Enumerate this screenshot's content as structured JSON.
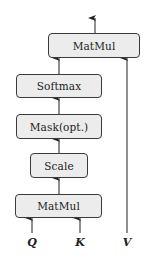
{
  "diagram": {
    "nodes": [
      {
        "id": "matmul_top",
        "label": "MatMul"
      },
      {
        "id": "softmax",
        "label": "Softmax"
      },
      {
        "id": "mask",
        "label": "Mask(opt.)"
      },
      {
        "id": "scale",
        "label": "Scale"
      },
      {
        "id": "matmul_bottom",
        "label": "MatMul"
      }
    ],
    "inputs": [
      {
        "id": "q",
        "label": "Q"
      },
      {
        "id": "k",
        "label": "K"
      },
      {
        "id": "v",
        "label": "V"
      }
    ],
    "edges": [
      {
        "from": "q",
        "to": "matmul_bottom"
      },
      {
        "from": "k",
        "to": "matmul_bottom"
      },
      {
        "from": "matmul_bottom",
        "to": "scale"
      },
      {
        "from": "scale",
        "to": "mask"
      },
      {
        "from": "mask",
        "to": "softmax"
      },
      {
        "from": "softmax",
        "to": "matmul_top"
      },
      {
        "from": "v",
        "to": "matmul_top"
      },
      {
        "from": "matmul_top",
        "to": "output"
      }
    ],
    "colors": {
      "box_fill": "#ececec",
      "stroke": "#3a3a3a"
    }
  }
}
